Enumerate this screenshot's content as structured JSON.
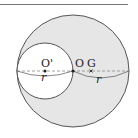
{
  "diagram": {
    "colors": {
      "fill": "#e6e6e6",
      "stroke": "#444444",
      "dash": "#888888",
      "rule": "#777777"
    },
    "outer_circle": {
      "cx": 73,
      "cy": 71,
      "r": 56,
      "center_label": "O"
    },
    "inner_circle": {
      "cx": 45,
      "cy": 71,
      "r": 28,
      "center_label": "O'"
    },
    "points": [
      {
        "label": "O'",
        "x": 45,
        "y": 71,
        "marker": "dot"
      },
      {
        "label": "O",
        "x": 73,
        "y": 71,
        "marker": "dot"
      },
      {
        "label": "G",
        "x": 91,
        "y": 71,
        "marker": "cross"
      }
    ],
    "dimensions": [
      {
        "label": "r",
        "from": "left edge",
        "to": "O",
        "note": "diameter of inner circle"
      },
      {
        "label": "r",
        "from": "O",
        "to": "right edge",
        "note": "radius of outer circle"
      }
    ],
    "labels": {
      "o_prime": "O'",
      "o": "O",
      "g": "G",
      "r_left": "r",
      "r_right": "r"
    }
  }
}
